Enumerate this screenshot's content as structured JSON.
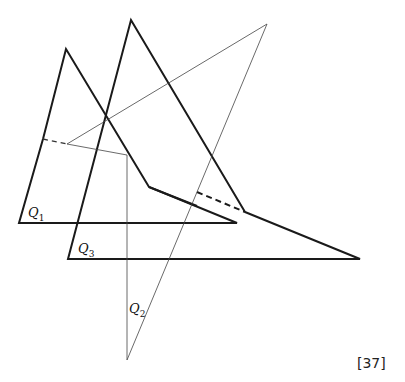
{
  "figure": {
    "labels": {
      "q1": {
        "letter": "Q",
        "sub": "1"
      },
      "q2": {
        "letter": "Q",
        "sub": "2"
      },
      "q3": {
        "letter": "Q",
        "sub": "3"
      }
    },
    "reference": "[37]"
  }
}
